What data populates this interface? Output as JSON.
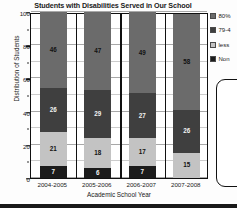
{
  "chart_data": {
    "type": "bar",
    "subtype": "stacked-bar",
    "title": "Students with Disabilities Served in Our School",
    "xlabel": "Academic School Year",
    "ylabel": "Distribution of Students",
    "categories": [
      "2004-2005",
      "2005-2006",
      "2006-2007",
      "2007-2008"
    ],
    "ylim": [
      0,
      100
    ],
    "yticks": [
      0,
      20,
      40,
      60,
      80,
      100
    ],
    "ytick_labels": [
      "0",
      "20",
      "40",
      "60",
      "80",
      "100"
    ],
    "grid": true,
    "legend_position": "right",
    "series": [
      {
        "name": "80%",
        "legend_label": "80%",
        "color": "#6b6b6b",
        "label_color": "#111111",
        "values": [
          46,
          47,
          49,
          58
        ]
      },
      {
        "name": "79-4",
        "legend_label": "79-4",
        "color": "#3f3f3f",
        "label_color": "#f2f2f2",
        "values": [
          26,
          29,
          27,
          26
        ]
      },
      {
        "name": "less",
        "legend_label": "less",
        "color": "#c3c3c3",
        "label_color": "#111111",
        "values": [
          21,
          18,
          17,
          15
        ]
      },
      {
        "name": "Non",
        "legend_label": "Non",
        "color": "#1c1c1c",
        "label_color": "#f2f2f2",
        "values": [
          7,
          6,
          7,
          0
        ]
      }
    ]
  },
  "legend": {
    "items": [
      {
        "label": "80%",
        "color": "#6b6b6b"
      },
      {
        "label": "79-4",
        "color": "#3f3f3f"
      },
      {
        "label": "less",
        "color": "#c3c3c3"
      },
      {
        "label": "Non",
        "color": "#1c1c1c"
      }
    ]
  },
  "axes": {
    "y_ticks": [
      "100",
      "80",
      "60",
      "40",
      "20",
      "0"
    ],
    "x_ticks": [
      "2004-2005",
      "2005-2006",
      "2006-2007",
      "2007-2008"
    ],
    "y_title": "Distribution of Students",
    "x_title": "Academic School Year"
  },
  "bar_labels": {
    "bar0": [
      "46",
      "26",
      "21",
      "7"
    ],
    "bar1": [
      "47",
      "29",
      "18",
      "6"
    ],
    "bar2": [
      "49",
      "27",
      "17",
      "7"
    ],
    "bar3": [
      "58",
      "26",
      "15",
      ""
    ]
  },
  "colors": {
    "axis": "#111111",
    "grid": "#b9b9b9",
    "plot_bg": "#ffffff",
    "page_bg": "#fdfdfd"
  }
}
